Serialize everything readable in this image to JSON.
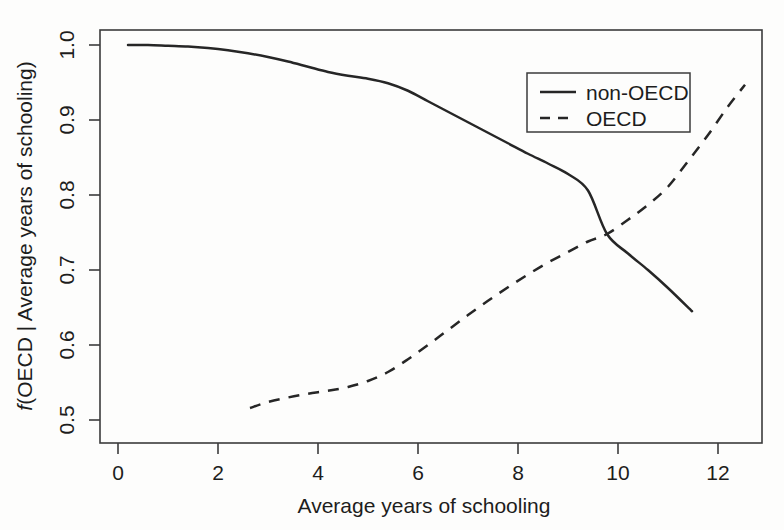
{
  "chart_data": {
    "type": "line",
    "title": "",
    "xlabel": "Average years of schooling",
    "ylabel": "f(OECD | Average years of schooling)",
    "ylabel_italic_prefix": "f",
    "ylabel_rest": "(OECD | Average years of schooling)",
    "xlim": [
      -0.36,
      12.88
    ],
    "ylim": [
      0.46,
      1.018
    ],
    "xticks": [
      0,
      2,
      4,
      6,
      8,
      10,
      12
    ],
    "xtick_labels": [
      "0",
      "2",
      "4",
      "6",
      "8",
      "10",
      "12"
    ],
    "yticks": [
      0.5,
      0.6,
      0.7,
      0.8,
      0.9,
      1.0
    ],
    "ytick_labels": [
      "0.5",
      "0.6",
      "0.7",
      "0.8",
      "0.9",
      "1.0"
    ],
    "grid": false,
    "legend_position": "top-right",
    "series": [
      {
        "name": "non-OECD",
        "style": "solid",
        "color": "#262626",
        "x": [
          0.2,
          0.6,
          1.0,
          1.4,
          1.8,
          2.2,
          2.6,
          3.0,
          3.4,
          3.8,
          4.2,
          4.6,
          5.0,
          5.4,
          5.8,
          6.2,
          6.6,
          7.0,
          7.4,
          7.8,
          8.2,
          8.6,
          9.0,
          9.4,
          9.78,
          10.2,
          10.6,
          11.0,
          11.48
        ],
        "y": [
          1.0,
          1.0,
          0.999,
          0.998,
          0.996,
          0.993,
          0.989,
          0.984,
          0.978,
          0.971,
          0.964,
          0.959,
          0.955,
          0.949,
          0.939,
          0.925,
          0.911,
          0.897,
          0.883,
          0.869,
          0.855,
          0.842,
          0.828,
          0.806,
          0.748,
          0.722,
          0.7,
          0.676,
          0.645
        ]
      },
      {
        "name": "OECD",
        "style": "dashed",
        "color": "#262626",
        "x": [
          2.64,
          3.0,
          3.4,
          3.8,
          4.2,
          4.6,
          5.0,
          5.4,
          5.8,
          6.2,
          6.6,
          7.0,
          7.4,
          7.8,
          8.2,
          8.6,
          9.0,
          9.4,
          9.78,
          10.2,
          10.6,
          11.0,
          11.4,
          11.8,
          12.2,
          12.54
        ],
        "y": [
          0.516,
          0.524,
          0.53,
          0.535,
          0.539,
          0.544,
          0.552,
          0.564,
          0.581,
          0.6,
          0.62,
          0.64,
          0.659,
          0.677,
          0.694,
          0.71,
          0.724,
          0.738,
          0.748,
          0.767,
          0.787,
          0.811,
          0.845,
          0.88,
          0.918,
          0.947
        ]
      }
    ],
    "legend": [
      {
        "label": "non-OECD",
        "style": "solid"
      },
      {
        "label": "OECD",
        "style": "dashed"
      }
    ]
  }
}
